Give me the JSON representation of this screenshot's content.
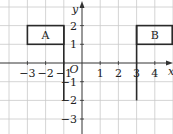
{
  "diagram": {
    "type": "coordinate-grid",
    "axes": {
      "x_label": "x",
      "y_label": "y",
      "origin_label": "O",
      "x_ticks": [
        {
          "value": -3,
          "label": "−3"
        },
        {
          "value": -2,
          "label": "−2"
        },
        {
          "value": -1,
          "label": "−1"
        },
        {
          "value": 1,
          "label": "1"
        },
        {
          "value": 2,
          "label": "2"
        },
        {
          "value": 3,
          "label": "3"
        },
        {
          "value": 4,
          "label": "4"
        }
      ],
      "y_ticks": [
        {
          "value": 2,
          "label": "2"
        },
        {
          "value": 1,
          "label": "1"
        },
        {
          "value": -1,
          "label": "−1"
        },
        {
          "value": -2,
          "label": "−2"
        },
        {
          "value": -3,
          "label": "−3"
        }
      ],
      "x_range": [
        -4,
        5
      ],
      "y_range": [
        -3.5,
        3
      ]
    },
    "flags": [
      {
        "label": "A",
        "rect": {
          "x1": -3,
          "y1": 1,
          "x2": -1,
          "y2": 2
        },
        "pole": {
          "x": -1,
          "y_top": 2,
          "y_bottom": -2
        }
      },
      {
        "label": "B",
        "rect": {
          "x1": 3,
          "y1": 1,
          "x2": 5,
          "y2": 2
        },
        "pole": {
          "x": 3,
          "y_top": 2,
          "y_bottom": -2
        }
      }
    ],
    "colors": {
      "grid": "#c9c9c9",
      "axis": "#333333",
      "flag": "#2a2a2a"
    }
  }
}
